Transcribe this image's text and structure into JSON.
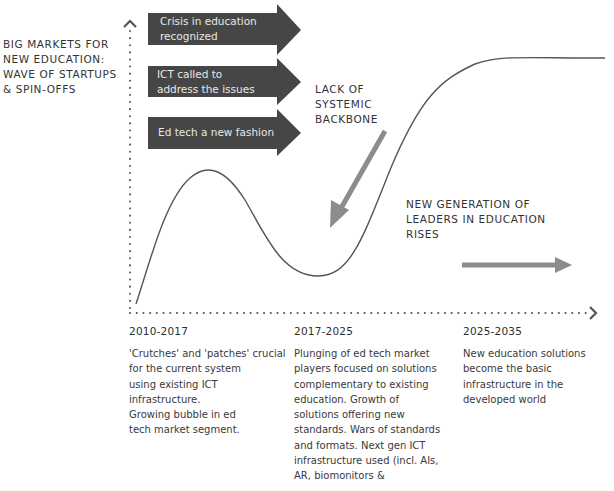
{
  "y_axis_label": "BIG MARKETS FOR\nNEW EDUCATION:\nWAVE OF STARTUPS\n& SPIN-OFFS",
  "dark_arrows": [
    {
      "label": "Crisis in education\nrecognized"
    },
    {
      "label": "ICT called to\naddress the issues"
    },
    {
      "label": "Ed tech a new fashion"
    }
  ],
  "annotations": {
    "lack_backbone": "LACK OF\nSYSTEMIC\nBACKBONE",
    "new_generation": "NEW GENERATION OF\nLEADERS IN EDUCATION\nRISES"
  },
  "periods": [
    {
      "range": "2010-2017",
      "description": "'Crutches' and 'patches' crucial\nfor the current system\nusing existing ICT\ninfrastructure.\nGrowing bubble in ed\ntech market segment."
    },
    {
      "range": "2017-2025",
      "description": "Plunging of ed tech market\nplayers focused on solutions\ncomplementary to existing\neducation. Growth of\nsolutions offering new\nstandards. Wars of standards\nand formats. Next gen ICT\ninfrastructure used (incl. AIs,\nAR, biomonitors &"
    },
    {
      "range": "2025-2035",
      "description": "New education solutions\nbecome the basic\ninfrastructure in the\ndeveloped world"
    }
  ],
  "colors": {
    "dark_arrow": "#464646",
    "gray_arrow": "#8c8c8c",
    "curve": "#555555",
    "axis_dots": "#555555"
  }
}
